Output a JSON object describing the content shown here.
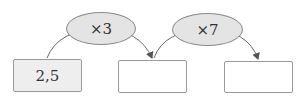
{
  "diagram": {
    "type": "arrow-chain",
    "operations": [
      {
        "label": "×3"
      },
      {
        "label": "×7"
      }
    ],
    "boxes": [
      {
        "value": "2,5",
        "filled": true
      },
      {
        "value": "",
        "filled": false
      },
      {
        "value": "",
        "filled": false
      }
    ],
    "colors": {
      "ellipse_fill": "#e4e4e4",
      "ellipse_border": "#8a8a8a",
      "box_border": "#9a9a9a",
      "given_box_fill": "#eeeeee",
      "arrow": "#555555"
    }
  }
}
